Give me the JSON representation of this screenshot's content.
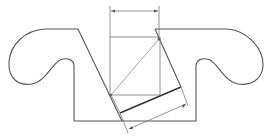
{
  "diagram": {
    "title": "",
    "colors": {
      "stroke": "#555555",
      "background": "#ffffff"
    },
    "labels": []
  }
}
